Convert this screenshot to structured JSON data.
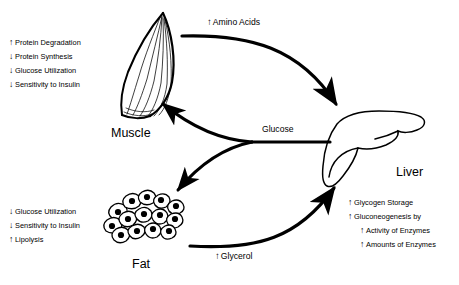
{
  "figure": {
    "background": "#ffffff",
    "ink": "#000000"
  },
  "organs": {
    "muscle": {
      "label": "Muscle",
      "icon": "muscle-icon",
      "annotations": [
        {
          "arrow": "↑",
          "direction": "up",
          "text": "Protein Degradation"
        },
        {
          "arrow": "↓",
          "direction": "down",
          "text": "Protein Synthesis"
        },
        {
          "arrow": "↓",
          "direction": "down",
          "text": "Glucose Utilization"
        },
        {
          "arrow": "↓",
          "direction": "down",
          "text": "Sensitivity to Insulin"
        }
      ]
    },
    "fat": {
      "label": "Fat",
      "icon": "adipocyte-cluster-icon",
      "annotations": [
        {
          "arrow": "↓",
          "direction": "down",
          "text": "Glucose Utilization"
        },
        {
          "arrow": "↓",
          "direction": "down",
          "text": "Sensitivity to Insulin"
        },
        {
          "arrow": "↑",
          "direction": "up",
          "text": "Lipolysis"
        }
      ]
    },
    "liver": {
      "label": "Liver",
      "icon": "liver-icon",
      "annotations": [
        {
          "arrow": "↑",
          "direction": "up",
          "text": "Glycogen Storage",
          "indent": false
        },
        {
          "arrow": "↑",
          "direction": "up",
          "text": "Gluconeogenesis by",
          "indent": false
        },
        {
          "arrow": "↑",
          "direction": "up",
          "text": "Activity of Enzymes",
          "indent": true
        },
        {
          "arrow": "↑",
          "direction": "up",
          "text": "Amounts of Enzymes",
          "indent": true
        }
      ]
    }
  },
  "fluxes": [
    {
      "id": "amino-acids",
      "arrow": "↑",
      "text": "Amino Acids",
      "from": "muscle",
      "to": "liver"
    },
    {
      "id": "glucose",
      "arrow": "",
      "text": "Glucose",
      "from": "liver",
      "to": "muscle, fat"
    },
    {
      "id": "glycerol",
      "arrow": "↑",
      "text": "Glycerol",
      "from": "fat",
      "to": "liver"
    }
  ]
}
